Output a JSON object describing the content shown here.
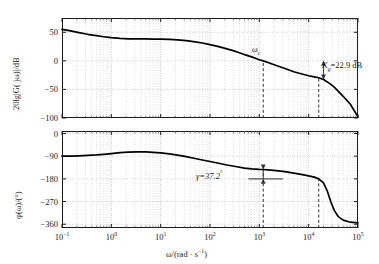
{
  "figure": {
    "xlabel_main": "ω/(rad · s",
    "xlabel_sup": "−1",
    "xlabel_tail": ")",
    "xticks": [
      {
        "mant": "10",
        "exp": "−1"
      },
      {
        "mant": "10",
        "exp": "0"
      },
      {
        "mant": "10",
        "exp": "1"
      },
      {
        "mant": "10",
        "exp": "2"
      },
      {
        "mant": "10",
        "exp": "3"
      },
      {
        "mant": "10",
        "exp": "4"
      },
      {
        "mant": "10",
        "exp": "5"
      }
    ]
  },
  "magnitude": {
    "ylabel": "20lg|G( jω)|/dB",
    "yticks": [
      "50",
      "0",
      "−50",
      "−100"
    ],
    "annotations": {
      "wc": "ω",
      "wc_sub": "c",
      "kg": "=22.9 dB",
      "kg_sym": "K",
      "kg_sub": "g"
    }
  },
  "phase": {
    "ylabel": "φ(ω)/(°)",
    "yticks": [
      "0",
      "−90",
      "−180",
      "−270",
      "−360"
    ],
    "annotations": {
      "gamma": "γ=37.2",
      "gamma_deg": "°"
    }
  },
  "chart_data": {
    "type": "line",
    "title": "",
    "xlabel": "ω/(rad · s⁻¹)",
    "xscale": "log",
    "xlim": [
      0.1,
      100000
    ],
    "panels": [
      {
        "name": "magnitude",
        "ylabel": "20lg|G(jω)|/dB",
        "ylim": [
          -100,
          75
        ],
        "yticks": [
          50,
          0,
          -50,
          -100
        ],
        "grid": true,
        "series": [
          {
            "name": "open-loop magnitude",
            "x": [
              0.1,
              0.15,
              0.22,
              0.33,
              0.5,
              0.7,
              1.0,
              1.5,
              2.2,
              3.3,
              5.0,
              7.0,
              10,
              15,
              22,
              33,
              50,
              70,
              100,
              150,
              220,
              330,
              500,
              700,
              1000,
              1200,
              1500,
              2200,
              3300,
              5000,
              7000,
              10000,
              13000,
              16000,
              20000,
              26000,
              33000,
              50000,
              70000,
              100000
            ],
            "y": [
              55.0,
              52.5,
              49.5,
              46.5,
              44.0,
              42.2,
              40.5,
              39.2,
              38.6,
              38.4,
              38.3,
              38.2,
              38.0,
              37.5,
              36.6,
              35.3,
              33.2,
              31.2,
              28.5,
              25.0,
              21.0,
              16.5,
              11.0,
              7.0,
              2.0,
              0.0,
              -3.0,
              -8.0,
              -13.5,
              -19.0,
              -22.5,
              -26.0,
              -28.0,
              -29.5,
              -32.5,
              -39.0,
              -46.0,
              -62.0,
              -76.0,
              -98.0
            ]
          }
        ],
        "markers": [
          {
            "type": "vline-dashed",
            "x": 1200,
            "label": "ωc",
            "y_from": -100,
            "y_to": 0
          },
          {
            "type": "vline-dashed",
            "x": 16000,
            "label": "",
            "y_from": -100,
            "y_to": -29.5
          },
          {
            "type": "double-arrow",
            "x": 20000,
            "y_from": 0,
            "y_to": -32.5,
            "label": "Kg=22.9 dB",
            "value": 22.9,
            "unit": "dB"
          }
        ]
      },
      {
        "name": "phase",
        "ylabel": "φ(ω)/(°)",
        "ylim": [
          -375,
          10
        ],
        "yticks": [
          0,
          -90,
          -180,
          -270,
          -360
        ],
        "grid": true,
        "series": [
          {
            "name": "open-loop phase",
            "x": [
              0.1,
              0.15,
              0.22,
              0.33,
              0.5,
              0.7,
              1.0,
              1.5,
              2.2,
              3.3,
              5.0,
              7.0,
              10,
              15,
              22,
              33,
              50,
              70,
              100,
              150,
              220,
              330,
              500,
              700,
              1000,
              1200,
              1500,
              2200,
              3300,
              5000,
              7000,
              10000,
              13000,
              16000,
              20000,
              24000,
              28000,
              33000,
              40000,
              50000,
              70000,
              100000
            ],
            "y": [
              -90.0,
              -89.5,
              -88.5,
              -87.0,
              -85.0,
              -82.5,
              -79.5,
              -76.0,
              -73.5,
              -72.5,
              -73.0,
              -74.5,
              -77.0,
              -81.0,
              -86.0,
              -92.0,
              -99.0,
              -105.0,
              -111.0,
              -118.0,
              -125.0,
              -131.0,
              -137.0,
              -140.5,
              -142.5,
              -142.8,
              -144.0,
              -147.0,
              -151.5,
              -157.0,
              -162.0,
              -168.0,
              -173.0,
              -180.0,
              -196.0,
              -230.0,
              -270.0,
              -305.0,
              -330.0,
              -344.0,
              -352.0,
              -355.0
            ]
          }
        ],
        "markers": [
          {
            "type": "vline-dashed",
            "x": 1200,
            "y_from": -375,
            "y_to": -142.8
          },
          {
            "type": "vline-dashed",
            "x": 16000,
            "y_from": -375,
            "y_to": -180
          },
          {
            "type": "double-arrow",
            "x": 1200,
            "y_from": -180,
            "y_to": -142.8,
            "label": "γ=37.2°",
            "value": 37.2,
            "unit": "deg"
          },
          {
            "type": "hline",
            "y": -180,
            "x_from": 600,
            "x_to": 3000
          }
        ]
      }
    ]
  }
}
